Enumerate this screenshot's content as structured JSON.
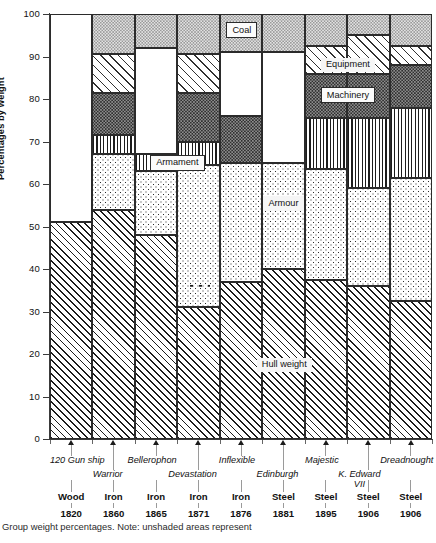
{
  "chart_data": {
    "type": "bar",
    "title": "",
    "subtitle": "",
    "xlabel": "",
    "ylabel": "Percentages by weight",
    "ylim": [
      0,
      100
    ],
    "ytick_values": [
      0,
      10,
      20,
      30,
      40,
      50,
      60,
      70,
      80,
      90,
      100
    ],
    "ytick_labels": [
      "0",
      "10",
      "20",
      "30",
      "40",
      "50",
      "60",
      "70",
      "80",
      "90",
      "100"
    ],
    "grid": false,
    "legend_position": "in-plot callouts",
    "stacked": true,
    "note": "unshaded (white) areas represent categories not recorded for that ship",
    "categories": [
      "120 Gun ship",
      "Warrior",
      "Bellerophon",
      "Devastation",
      "Inflexible",
      "Edinburgh",
      "Majestic",
      "K. Edward VII",
      "Dreadnought"
    ],
    "materials": [
      "Wood",
      "Iron",
      "Iron",
      "Iron",
      "Iron",
      "Steel",
      "Steel",
      "Steel",
      "Steel"
    ],
    "years": [
      "1820",
      "1860",
      "1865",
      "1871",
      "1876",
      "1881",
      "1895",
      "1906",
      "1906"
    ],
    "series": [
      {
        "name": "Hull weight",
        "pattern": "diagonal-hatch",
        "values": [
          51,
          54,
          48,
          31,
          37,
          40,
          37.5,
          36,
          32.5
        ]
      },
      {
        "name": "Armour",
        "pattern": "coarse-dots",
        "values": [
          0,
          13,
          15,
          33.5,
          28,
          25,
          26,
          23,
          29
        ]
      },
      {
        "name": "Armament",
        "pattern": "vertical-lines",
        "values": [
          0,
          4.5,
          4,
          5.5,
          0,
          0,
          12,
          16.5,
          16.5
        ]
      },
      {
        "name": "Machinery",
        "pattern": "dark-stipple",
        "values": [
          0,
          10,
          0,
          11.5,
          11,
          0,
          10.5,
          10.5,
          10
        ]
      },
      {
        "name": "Equipment",
        "pattern": "fine-diagonal-hatch",
        "values": [
          0,
          9,
          0,
          9,
          0,
          0,
          6.5,
          9,
          4.5
        ]
      },
      {
        "name": "unshaded",
        "pattern": "blank",
        "values": [
          49,
          0,
          25,
          0,
          15,
          26,
          0,
          0,
          0
        ]
      },
      {
        "name": "Coal",
        "pattern": "light-stipple",
        "values": [
          0,
          9.5,
          8,
          9.5,
          9,
          9,
          7.5,
          5,
          7.5
        ]
      }
    ],
    "stack_tops": {
      "120 Gun ship": {
        "hull": 51,
        "armour": 51,
        "armament": 51,
        "machinery": 51,
        "equipment": 51,
        "blank": 100,
        "coal": 100
      },
      "Warrior": {
        "hull": 54,
        "armour": 67,
        "armament": 71.5,
        "machinery": 81.5,
        "equipment": 90.5,
        "blank": 90.5,
        "coal": 100
      },
      "Bellerophon": {
        "hull": 48,
        "armour": 63,
        "armament": 67,
        "machinery": 67,
        "equipment": 67,
        "blank": 92,
        "coal": 100
      },
      "Devastation": {
        "hull": 31,
        "armour": 64.5,
        "armament": 70,
        "machinery": 81.5,
        "equipment": 90.5,
        "blank": 90.5,
        "coal": 100
      },
      "Inflexible": {
        "hull": 37,
        "armour": 65,
        "armament": 65,
        "machinery": 76,
        "equipment": 76,
        "blank": 91,
        "coal": 100
      },
      "Edinburgh": {
        "hull": 40,
        "armour": 65,
        "armament": 65,
        "machinery": 65,
        "equipment": 65,
        "blank": 91,
        "coal": 100
      },
      "Majestic": {
        "hull": 37.5,
        "armour": 63.5,
        "armament": 75.5,
        "machinery": 86,
        "equipment": 92.5,
        "blank": 92.5,
        "coal": 100
      },
      "K. Edward VII": {
        "hull": 36,
        "armour": 59,
        "armament": 75.5,
        "machinery": 86,
        "equipment": 95,
        "blank": 95,
        "coal": 100
      },
      "Dreadnought": {
        "hull": 32.5,
        "armour": 61.5,
        "armament": 78,
        "machinery": 88,
        "equipment": 92.5,
        "blank": 92.5,
        "coal": 100
      }
    },
    "annotations": [
      {
        "text": "Coal",
        "x_index": 4,
        "y": 96
      },
      {
        "text": "Equipment",
        "x_index": 7,
        "y": 88
      },
      {
        "text": "Machinery",
        "x_index": 7,
        "y": 81
      },
      {
        "text": "Armament",
        "x_index": 2,
        "y": 65
      },
      {
        "text": "Armour",
        "x_index": 5,
        "y": 55
      },
      {
        "text": "Hull weight",
        "x_index": 5,
        "y": 17
      }
    ]
  },
  "axis": {
    "y_title": "Percentages by weight",
    "y_labels": [
      "100",
      "90",
      "80",
      "70",
      "60",
      "50",
      "40",
      "30",
      "20",
      "10",
      "0"
    ]
  },
  "annotations": {
    "coal": "Coal",
    "equipment": "Equipment",
    "machinery": "Machinery",
    "armament": "Armament",
    "armour": "Armour",
    "hull": "Hull weight"
  },
  "ships": [
    {
      "name": "120 Gun ship",
      "material": "Wood",
      "year": "1820"
    },
    {
      "name": "Warrior",
      "material": "Iron",
      "year": "1860"
    },
    {
      "name": "Bellerophon",
      "material": "Iron",
      "year": "1865"
    },
    {
      "name": "Devastation",
      "material": "Iron",
      "year": "1871"
    },
    {
      "name": "Inflexible",
      "material": "Iron",
      "year": "1876"
    },
    {
      "name": "Edinburgh",
      "material": "Steel",
      "year": "1881"
    },
    {
      "name": "Majestic",
      "material": "Steel",
      "year": "1895"
    },
    {
      "name": "K. Edward VII",
      "material": "Steel",
      "year": "1906"
    },
    {
      "name": "Dreadnought",
      "material": "Steel",
      "year": "1906"
    }
  ],
  "caption": "Group weight percentages. Note: unshaded areas represent"
}
